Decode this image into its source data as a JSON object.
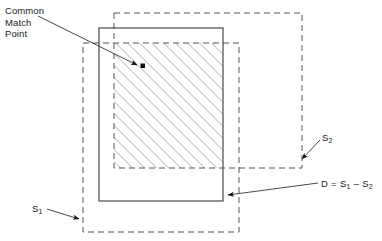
{
  "figure": {
    "background_color": "#ffffff",
    "line_color": "#333333",
    "hatch_color": "#8c8c8c"
  },
  "labels": {
    "common_match_point": "Common\nMatch\nPoint",
    "s2": "S",
    "s2_sub": "2",
    "s1": "S",
    "s1_sub": "1",
    "formula_d": "D = S",
    "formula_sub1": "1",
    "formula_minus": " – S",
    "formula_sub2": "2"
  },
  "shapes": {
    "solid_rect": {
      "name": "base-image-rectangle",
      "style": "solid",
      "x": 99,
      "y": 28,
      "width": 124,
      "height": 173
    },
    "s2_rect": {
      "name": "s2-dashed-rectangle",
      "style": "dashed",
      "x": 114,
      "y": 13,
      "width": 188,
      "height": 155
    },
    "s1_rect": {
      "name": "s1-dashed-rectangle",
      "style": "dashed",
      "x": 83,
      "y": 43,
      "width": 156,
      "height": 189
    },
    "overlap_region": {
      "name": "hatched-overlap-region",
      "x": 114,
      "y": 43,
      "width": 109,
      "height": 125,
      "hatch_angle_degrees": 45,
      "hatch_spacing_px": 6
    }
  },
  "leader_lines": [
    {
      "name": "common-match-point-leader",
      "from_x": 38,
      "from_y": 16,
      "to_x": 139,
      "to_y": 66,
      "arrow": true
    },
    {
      "name": "s2-leader",
      "from_x": 320,
      "from_y": 140,
      "to_x": 300,
      "to_y": 160,
      "arrow": true
    },
    {
      "name": "formula-leader",
      "from_x": 318,
      "from_y": 184,
      "to_x": 226,
      "to_y": 196,
      "arrow": true
    },
    {
      "name": "s1-leader",
      "from_x": 47,
      "from_y": 209,
      "to_x": 81,
      "to_y": 220,
      "arrow": true
    }
  ]
}
